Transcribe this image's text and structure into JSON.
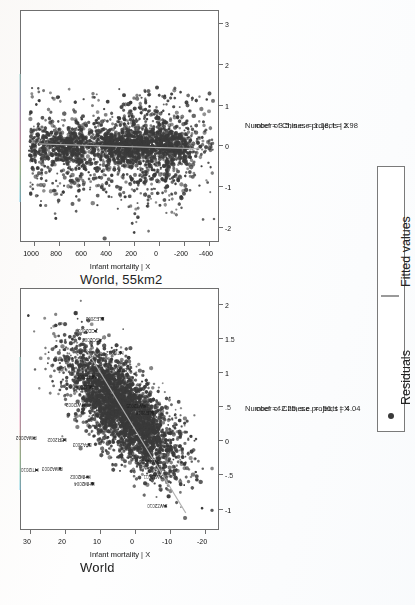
{
  "figure": {
    "orientation": "landscape-page-rotated-90ccw",
    "point_color": "#3a3a3a",
    "fit_color": "#b0b0b0",
    "frame_color": "#6f6f6f"
  },
  "legend": {
    "items": [
      {
        "marker": "dot",
        "label": "Residuals"
      },
      {
        "marker": "line",
        "label": "Fitted values"
      }
    ]
  },
  "chart_data": [
    {
      "id": "panel-top",
      "type": "scatter",
      "title": "World, 55km2",
      "xlabel": "Number of Chinese projects | X",
      "ylabel": "Infant mortality | X",
      "annotation": "coef = 3.5, s.e. = 1.18, t = 2.98",
      "coef": 3.5,
      "se": 1.18,
      "t": 2.98,
      "xticks": [
        -2,
        -1,
        0,
        1,
        2,
        3
      ],
      "xticklabels": [
        "-2",
        "-1",
        "0",
        "1",
        "2",
        "3"
      ],
      "yticks": [
        -400,
        -200,
        0,
        200,
        400,
        600,
        800,
        1000
      ],
      "yticklabels": [
        "-400",
        "-200",
        "0",
        "200",
        "400",
        "600",
        "800",
        "1000"
      ],
      "xlim": [
        -2.35,
        3.35
      ],
      "ylim": [
        -480,
        1110
      ],
      "grid": false,
      "legend_position": "right-outside",
      "fit_line": {
        "x0": -0.06,
        "y0": -330,
        "x1": 0.06,
        "y1": 960
      },
      "point_labels": []
    },
    {
      "id": "panel-bottom",
      "type": "scatter",
      "title": "World",
      "xlabel": "Number of Chinese projects | X",
      "ylabel": "Infant mortality | X",
      "annotation": "coef = -2.25, s.e. = .56, t = 4.04",
      "coef": -2.25,
      "se": 0.56,
      "t": 4.04,
      "xticks": [
        -1,
        -0.5,
        0,
        0.5,
        1,
        1.5,
        2
      ],
      "xticklabels": [
        "-1",
        "-.5",
        "0",
        ".5",
        "1",
        "1.5",
        "2"
      ],
      "yticks": [
        -20,
        -10,
        0,
        10,
        20,
        30
      ],
      "yticklabels": [
        "-20",
        "-10",
        "0",
        "10",
        "20",
        "30"
      ],
      "xlim": [
        -1.3,
        2.25
      ],
      "ylim": [
        -24,
        33
      ],
      "grid": false,
      "legend_position": "right-outside",
      "fit_line": {
        "x0": -1.05,
        "y0": -14.5,
        "x1": 1.35,
        "y1": 14.0
      },
      "point_labels": [
        {
          "text": "RWA2002",
          "x": 0.05,
          "y": 29.0
        },
        {
          "text": "HTI2010",
          "x": -0.42,
          "y": 28.3
        },
        {
          "text": "RWA2003",
          "x": -0.4,
          "y": 21.5
        },
        {
          "text": "LBR2002",
          "x": 0.02,
          "y": 20.3
        },
        {
          "text": "MWI2002",
          "x": 0.53,
          "y": 15.0
        },
        {
          "text": "KHM2002",
          "x": -0.52,
          "y": 13.6
        },
        {
          "text": "KHM2004",
          "x": -0.62,
          "y": 12.3
        },
        {
          "text": "BFA2003",
          "x": -0.05,
          "y": 13.2
        },
        {
          "text": "MLI2006",
          "x": 0.8,
          "y": 12.7
        },
        {
          "text": "NER2006",
          "x": 0.95,
          "y": 11.9
        },
        {
          "text": "TCD2003",
          "x": 1.62,
          "y": 11.4
        },
        {
          "text": "AGO2003",
          "x": 1.48,
          "y": 10.1
        },
        {
          "text": "SLE2003",
          "x": 1.8,
          "y": 9.4
        },
        {
          "text": "SLB2002",
          "x": 1.05,
          "y": 1.5
        },
        {
          "text": "SWZ2015",
          "x": 0.52,
          "y": -2.6
        },
        {
          "text": "SLE2016",
          "x": 0.42,
          "y": -4.9
        },
        {
          "text": "SWZ2010",
          "x": -0.95,
          "y": -8.6
        },
        {
          "text": "SWZ2011",
          "x": -0.52,
          "y": -7.4
        },
        {
          "text": "SWZ2006",
          "x": -0.3,
          "y": -6.2
        },
        {
          "text": "HTI2012",
          "x": 1.3,
          "y": 4.2
        }
      ]
    }
  ]
}
